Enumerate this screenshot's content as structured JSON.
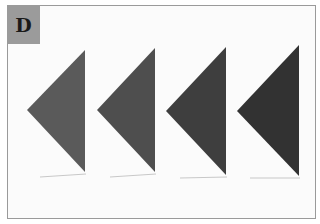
{
  "panel": {
    "label": "D",
    "label_bg": "#9b9b9b",
    "border_color": "#9a9a9a"
  },
  "figure": {
    "triangles": [
      {
        "id": 1,
        "fill": "#5a5a5a",
        "points": "85,50 85,172 27,110"
      },
      {
        "id": 2,
        "fill": "#4e4e4e",
        "points": "155,48 155,172 97,110"
      },
      {
        "id": 3,
        "fill": "#3e3e3e",
        "points": "226,47 226,175 166,111"
      },
      {
        "id": 4,
        "fill": "#323232",
        "points": "299,45 299,176 237,111"
      }
    ]
  }
}
